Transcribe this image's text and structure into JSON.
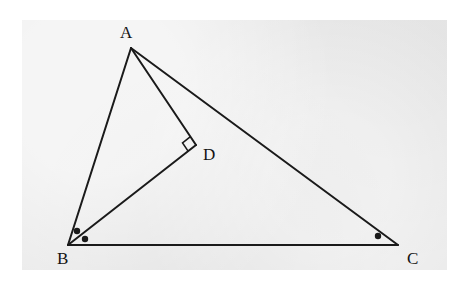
{
  "figure": {
    "kind": "euclidean-geometry-diagram",
    "panel": {
      "x": 22,
      "y": 20,
      "width": 425,
      "height": 250,
      "background_color": "#e9e9e9"
    },
    "page_background_color": "#ffffff",
    "stroke_color": "#1a1a1a",
    "stroke_width": 2,
    "points": {
      "A": {
        "label": "A",
        "x": 131,
        "y": 48,
        "label_x": 120,
        "label_y": 24
      },
      "B": {
        "label": "B",
        "x": 68,
        "y": 245,
        "label_x": 57,
        "label_y": 250
      },
      "C": {
        "label": "C",
        "x": 398,
        "y": 245,
        "label_x": 407,
        "label_y": 250
      },
      "D": {
        "label": "D",
        "x": 196,
        "y": 145,
        "label_x": 203,
        "label_y": 146
      }
    },
    "segments": [
      {
        "name": "AB",
        "from": "A",
        "to": "B"
      },
      {
        "name": "AC",
        "from": "A",
        "to": "C"
      },
      {
        "name": "BC",
        "from": "B",
        "to": "C"
      },
      {
        "name": "AD",
        "from": "A",
        "to": "D"
      },
      {
        "name": "BD",
        "from": "B",
        "to": "D"
      }
    ],
    "right_angle_marks": [
      {
        "name": "right-angle-at-D",
        "at": "D",
        "size": 10
      }
    ],
    "angle_dots": [
      {
        "name": "angle-dot-ABD",
        "x": 77,
        "y": 231,
        "r": 3.2
      },
      {
        "name": "angle-dot-DBC",
        "x": 85,
        "y": 239,
        "r": 3.2
      },
      {
        "name": "angle-dot-ACB",
        "x": 378,
        "y": 236,
        "r": 3.2
      }
    ]
  }
}
